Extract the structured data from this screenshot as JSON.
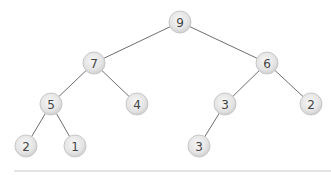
{
  "diagram": {
    "type": "binary-tree",
    "nodes": [
      {
        "id": "n0",
        "label": "9",
        "x": 180,
        "y": 22
      },
      {
        "id": "n1",
        "label": "7",
        "x": 94,
        "y": 63
      },
      {
        "id": "n2",
        "label": "6",
        "x": 267,
        "y": 63
      },
      {
        "id": "n3",
        "label": "5",
        "x": 51,
        "y": 104
      },
      {
        "id": "n4",
        "label": "4",
        "x": 137,
        "y": 104
      },
      {
        "id": "n5",
        "label": "3",
        "x": 225,
        "y": 104
      },
      {
        "id": "n6",
        "label": "2",
        "x": 311,
        "y": 104
      },
      {
        "id": "n7",
        "label": "2",
        "x": 26,
        "y": 146
      },
      {
        "id": "n8",
        "label": "1",
        "x": 75,
        "y": 146
      },
      {
        "id": "n9",
        "label": "3",
        "x": 199,
        "y": 146
      }
    ],
    "edges": [
      [
        "n0",
        "n1"
      ],
      [
        "n0",
        "n2"
      ],
      [
        "n1",
        "n3"
      ],
      [
        "n1",
        "n4"
      ],
      [
        "n2",
        "n5"
      ],
      [
        "n2",
        "n6"
      ],
      [
        "n3",
        "n7"
      ],
      [
        "n3",
        "n8"
      ],
      [
        "n5",
        "n9"
      ]
    ],
    "node_radius": 11,
    "colors": {
      "node_fill_center": "#f4f4f4",
      "node_fill_edge": "#d2d2d2",
      "edge": "#6e6e6e",
      "label": "#444444",
      "baseline": "#c9c9c9"
    },
    "baseline": {
      "x1": 14,
      "x2": 331,
      "y": 171
    }
  }
}
